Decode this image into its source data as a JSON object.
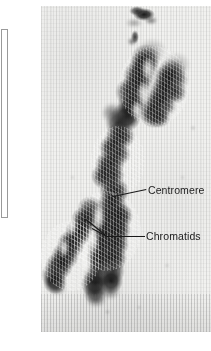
{
  "figure": {
    "type": "micrograph",
    "plate": {
      "x": 41,
      "y": 6,
      "width": 170,
      "height": 326,
      "background_color": "#f1f1ef",
      "grain": "vertical-streak film grain"
    },
    "caption_box": {
      "x": 1,
      "y": 29,
      "width": 7,
      "height": 189,
      "border_color": "#9a9a9a",
      "fill_color": "#ffffff",
      "text": ""
    }
  },
  "specimen": {
    "stain_color": "#141414",
    "orientation": "diagonal, upper-right to lower-left",
    "description": "two sister chromatids joined at a central constriction"
  },
  "callouts": [
    {
      "id": "centromere",
      "label": "Centromere",
      "text_color": "#1c1c1c",
      "label_x": 148,
      "label_y": 184,
      "leader": {
        "x1": 113,
        "y1": 196,
        "x2": 146,
        "y2": 189
      },
      "points_to": "central constriction joining the chromatids"
    },
    {
      "id": "chromatids",
      "label": "Chromatids",
      "text_color": "#1c1c1c",
      "label_x": 146,
      "label_y": 230,
      "leader": {
        "x1": 107,
        "y1": 236,
        "x2": 144,
        "y2": 236
      },
      "branches": [
        {
          "x1": 107,
          "y1": 236,
          "x2": 86,
          "y2": 219
        },
        {
          "x1": 107,
          "y1": 236,
          "x2": 92,
          "y2": 228
        }
      ],
      "points_to": "the two sister chromatid arms"
    }
  ]
}
